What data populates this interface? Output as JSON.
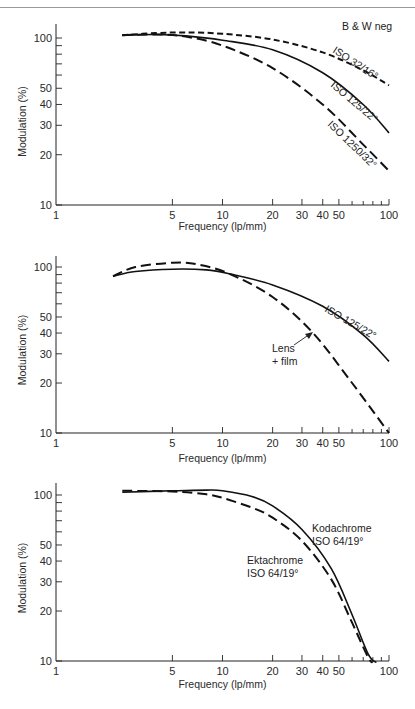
{
  "chart_data": [
    {
      "type": "line",
      "title": "B & W neg",
      "xlabel": "Frequency (lp/mm)",
      "ylabel": "Modulation (%)",
      "xscale": "log",
      "yscale": "log",
      "xlim": [
        1,
        100
      ],
      "ylim": [
        10,
        100
      ],
      "xticks": [
        "1",
        "5",
        "10",
        "20",
        "30",
        "40",
        "50",
        "100"
      ],
      "yticks": [
        "10",
        "20",
        "30",
        "40",
        "50",
        "100"
      ],
      "grid": false,
      "series": [
        {
          "name": "ISO 32/16°",
          "style": "short-dash",
          "x": [
            2.5,
            4,
            6,
            10,
            20,
            40,
            70,
            100
          ],
          "y": [
            104,
            107,
            108,
            106,
            98,
            82,
            64,
            52
          ]
        },
        {
          "name": "ISO 125/22°",
          "style": "solid",
          "x": [
            2.5,
            4,
            6,
            10,
            20,
            40,
            70,
            100
          ],
          "y": [
            104,
            105,
            103,
            97,
            85,
            62,
            40,
            27
          ]
        },
        {
          "name": "ISO 1250/32°",
          "style": "long-dash",
          "x": [
            2.5,
            4,
            6,
            10,
            20,
            40,
            70,
            100
          ],
          "y": [
            104,
            105,
            102,
            90,
            66,
            40,
            23,
            16
          ]
        }
      ]
    },
    {
      "type": "line",
      "title": "",
      "xlabel": "Frequency (lp/mm)",
      "ylabel": "Modulation (%)",
      "xscale": "log",
      "yscale": "log",
      "xlim": [
        1,
        100
      ],
      "ylim": [
        10,
        100
      ],
      "xticks": [
        "1",
        "5",
        "10",
        "20",
        "30",
        "40",
        "50",
        "100"
      ],
      "yticks": [
        "10",
        "20",
        "30",
        "40",
        "50",
        "100"
      ],
      "grid": false,
      "series": [
        {
          "name": "ISO 125/22°",
          "style": "solid",
          "x": [
            2.2,
            3,
            5,
            8,
            11,
            20,
            40,
            70,
            100
          ],
          "y": [
            88,
            94,
            97,
            96,
            91,
            78,
            58,
            39,
            27
          ]
        },
        {
          "name": "Lens + film",
          "style": "long-dash",
          "x": [
            2.2,
            3,
            5,
            7,
            11,
            20,
            35,
            60,
            100
          ],
          "y": [
            88,
            100,
            106,
            104,
            91,
            66,
            40,
            20,
            10
          ]
        }
      ],
      "annotations": [
        {
          "text": "Lens + film",
          "arrow_to": [
            35,
            41
          ]
        }
      ]
    },
    {
      "type": "line",
      "title": "",
      "xlabel": "Frequency (lp/mm)",
      "ylabel": "Modulation (%)",
      "xscale": "log",
      "yscale": "log",
      "xlim": [
        1,
        100
      ],
      "ylim": [
        10,
        100
      ],
      "xticks": [
        "1",
        "5",
        "10",
        "20",
        "30",
        "40",
        "50",
        "100"
      ],
      "yticks": [
        "10",
        "20",
        "30",
        "40",
        "50",
        "100"
      ],
      "grid": false,
      "series": [
        {
          "name": "Kodachrome ISO 64/19°",
          "style": "solid",
          "x": [
            2.5,
            5,
            8,
            10,
            15,
            20,
            30,
            45,
            60,
            75,
            84
          ],
          "y": [
            104,
            106,
            107,
            106,
            98,
            86,
            62,
            36,
            19,
            11,
            9.8
          ]
        },
        {
          "name": "Ektachrome ISO 64/19°",
          "style": "long-dash",
          "x": [
            2.5,
            5,
            8,
            10,
            15,
            20,
            30,
            45,
            60,
            75,
            80
          ],
          "y": [
            106,
            105,
            101,
            96,
            84,
            73,
            53,
            31,
            17,
            10.5,
            9.8
          ]
        }
      ]
    }
  ],
  "labels": {
    "chart1_title": "B & W neg",
    "chart1_series": [
      "ISO 32/16°",
      "ISO 125/22°",
      "ISO 1250/32°"
    ],
    "chart2_series": "ISO 125/22°",
    "chart2_lens_line1": "Lens",
    "chart2_lens_line2": "+ film",
    "chart3_kodachrome_line1": "Kodachrome",
    "chart3_kodachrome_line2": "ISO 64/19°",
    "chart3_ektachrome_line1": "Ektachrome",
    "chart3_ektachrome_line2": "ISO 64/19°",
    "xlabel": "Frequency (lp/mm)",
    "ylabel": "Modulation (%)"
  }
}
